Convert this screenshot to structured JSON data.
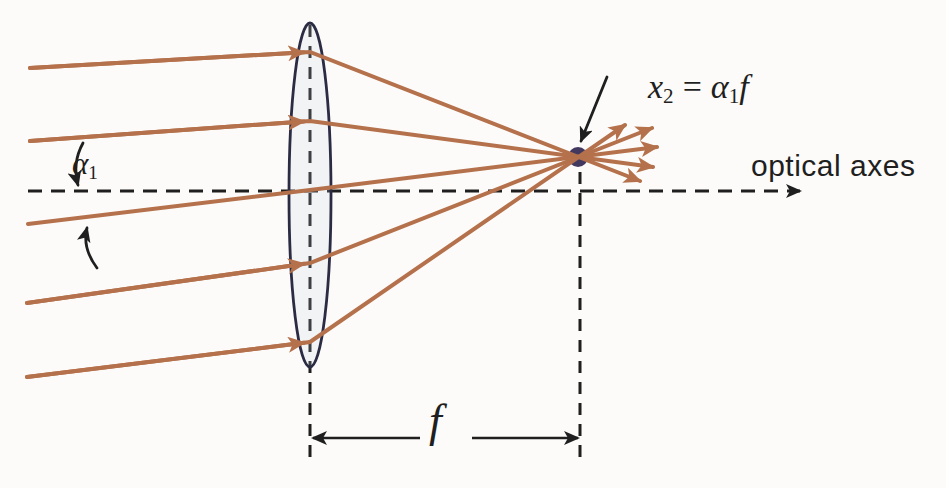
{
  "figure": {
    "type": "optics-ray-diagram",
    "ray_count": 5
  },
  "labels": {
    "angle": {
      "base": "α",
      "sub": "1"
    },
    "formula": {
      "lhs_base": "x",
      "lhs_sub": "2",
      "equals": "=",
      "rhs_base": "α",
      "rhs_sub": "1",
      "rhs_tail": "f"
    },
    "optical_axis": "optical axes",
    "focal_length": "f"
  },
  "colors": {
    "background": "#fcfbf9",
    "ink": "#1f1f1f",
    "ray": "#b4714b",
    "lens_stroke": "#2b2c44",
    "lens_fill": "rgba(200,212,230,0.18)",
    "focal_point": "#43395f"
  },
  "geometry": {
    "canvas": {
      "width": 946,
      "height": 488
    },
    "optical_axis": {
      "x1": 28,
      "x2": 800,
      "y": 191
    },
    "lens": {
      "cx": 310,
      "cy": 195,
      "rx": 21,
      "ry": 172
    },
    "lens_plane_dash": {
      "x": 310,
      "y1": 25,
      "y2": 462
    },
    "focal_plane_dash": {
      "x": 580,
      "y1": 172,
      "y2": 462
    },
    "focal_point": {
      "cx": 578,
      "cy": 157,
      "r": 10
    },
    "entry_arrow_x": 304,
    "rays": [
      {
        "start": [
          30,
          68
        ],
        "lens": [
          310,
          52
        ],
        "tip": [
          640,
          181
        ],
        "entry_arrow": true
      },
      {
        "start": [
          30,
          141
        ],
        "lens": [
          310,
          121
        ],
        "tip": [
          653,
          167
        ],
        "entry_arrow": true
      },
      {
        "start": [
          28,
          224
        ],
        "lens": [
          310,
          190
        ],
        "tip": [
          657,
          147
        ],
        "entry_arrow": false
      },
      {
        "start": [
          27,
          303
        ],
        "lens": [
          310,
          263
        ],
        "tip": [
          652,
          128
        ],
        "entry_arrow": true
      },
      {
        "start": [
          27,
          377
        ],
        "lens": [
          310,
          342
        ],
        "tip": [
          625,
          125
        ],
        "entry_arrow": true
      }
    ],
    "focus_pointer_arrow": {
      "from": [
        607,
        77
      ],
      "to": [
        581,
        141
      ]
    },
    "angle_arrow_down": {
      "path": "M83 143 Q72 163 78 185"
    },
    "angle_arrow_up": {
      "path": "M97 268 Q82 248 87 228"
    },
    "f_dimension": {
      "y": 438,
      "left_from": 420,
      "left_tip": 313,
      "right_from": 472,
      "right_tip": 578
    }
  }
}
